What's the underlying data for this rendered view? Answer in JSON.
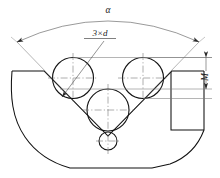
{
  "drawing": {
    "title": "V-groove three-ball measurement",
    "labels": {
      "angle": "α",
      "ball_callout": "3×d",
      "measure": "M"
    },
    "colors": {
      "outline": "#111111",
      "thin_line": "#777777",
      "center_line": "#6b6b6b",
      "dimension": "#555555",
      "text": "#1a1a1a",
      "background": "#ffffff"
    },
    "geometry": {
      "balls": [
        {
          "name": "upper-left-ball",
          "cx": 73,
          "cy": 78,
          "r": 20.5
        },
        {
          "name": "upper-right-ball",
          "cx": 143,
          "cy": 78,
          "r": 20.5
        },
        {
          "name": "lower-center-ball",
          "cx": 108,
          "cy": 110,
          "r": 21.0
        },
        {
          "name": "vertex-small-ball",
          "cx": 108,
          "cy": 141,
          "r": 9.0
        }
      ],
      "vee_angle_degrees": 90,
      "vee_vertex": {
        "x": 108,
        "y": 136
      },
      "measure_dimension": {
        "x": 206,
        "y_top": 60,
        "y_bottom": 89
      },
      "angle_arc": {
        "cx": 108,
        "cy": 168,
        "r": 152
      }
    }
  }
}
